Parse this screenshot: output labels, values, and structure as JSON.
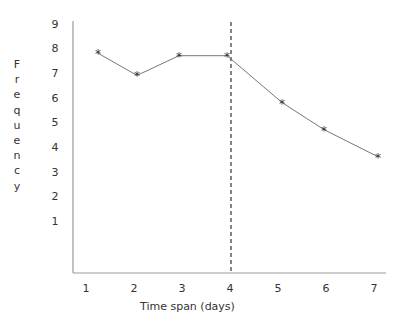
{
  "chart_data": {
    "type": "line",
    "title": "",
    "xlabel": "Time span (days)",
    "ylabel": "Frequency",
    "x": [
      1,
      2,
      3,
      4,
      5,
      6,
      7
    ],
    "x_tick_labels": [
      "1",
      "2",
      "3",
      "4",
      "5",
      "6",
      "7"
    ],
    "y_tick_labels": [
      "1",
      "2",
      "3",
      "4",
      "5",
      "6",
      "7",
      "8",
      "9"
    ],
    "ylim": [
      0,
      9
    ],
    "xlim": [
      1,
      7
    ],
    "series": [
      {
        "name": "Frequency",
        "marker": "*",
        "values": [
          7.8,
          6.9,
          7.7,
          7.7,
          5.8,
          4.7,
          3.6
        ]
      }
    ],
    "annotations": [
      {
        "type": "vertical-dashed-line",
        "x": 4
      }
    ],
    "grid": false,
    "legend": null
  },
  "colors": {
    "axis": "#999999",
    "line": "#777777",
    "marker": "#333333",
    "text": "#333333",
    "dashed": "#444444"
  }
}
